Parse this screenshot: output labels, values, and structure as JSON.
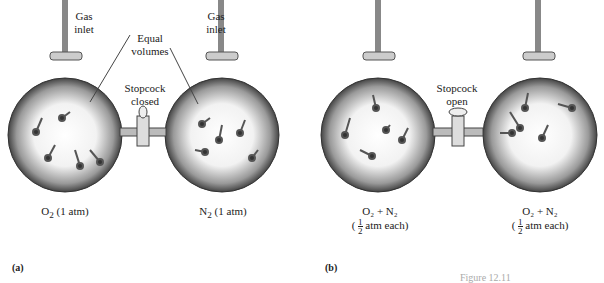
{
  "panel_a": {
    "tag": "(a)",
    "left_inlet": "Gas\ninlet",
    "right_inlet": "Gas\ninlet",
    "equal_volumes": "Equal volumes",
    "stopcock": "Stopcock closed",
    "left_bulb": {
      "formula": "O",
      "sub": "2",
      "pressure": " (1 atm)"
    },
    "right_bulb": {
      "formula": "N",
      "sub": "2",
      "pressure": " (1 atm)"
    }
  },
  "panel_b": {
    "tag": "(b)",
    "stopcock": "Stopcock open",
    "left_bulb": {
      "line1": "O₂ + N₂",
      "frac_num": "1",
      "frac_den": "2",
      "line2": "atm each)"
    },
    "right_bulb": {
      "line1": "O₂ + N₂",
      "frac_num": "1",
      "frac_den": "2",
      "line2": "atm each)"
    }
  },
  "caption": "Figure 12.11"
}
